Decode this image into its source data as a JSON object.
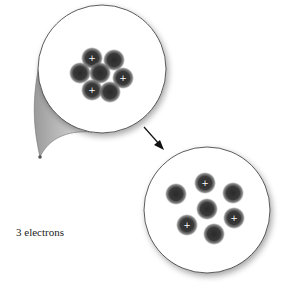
{
  "diagram": {
    "label": "3 electrons",
    "zoom_circle": {
      "cx": 102,
      "cy": 69,
      "r": 64,
      "description": "Compact nucleus (protons and neutrons clustered)",
      "particles": [
        {
          "x": 92,
          "y": 58,
          "proton": true
        },
        {
          "x": 114,
          "y": 60,
          "proton": false
        },
        {
          "x": 80,
          "y": 73,
          "proton": false
        },
        {
          "x": 100,
          "y": 73,
          "proton": false
        },
        {
          "x": 123,
          "y": 78,
          "proton": true
        },
        {
          "x": 92,
          "y": 90,
          "proton": true
        },
        {
          "x": 110,
          "y": 92,
          "proton": false
        }
      ]
    },
    "expanded_circle": {
      "cx": 207,
      "cy": 210,
      "r": 63,
      "description": "Nucleus expanded showing individual nucleons",
      "particles": [
        {
          "x": 205,
          "y": 183,
          "proton": true
        },
        {
          "x": 176,
          "y": 194,
          "proton": false
        },
        {
          "x": 233,
          "y": 193,
          "proton": false
        },
        {
          "x": 207,
          "y": 209,
          "proton": false
        },
        {
          "x": 234,
          "y": 218,
          "proton": true
        },
        {
          "x": 187,
          "y": 225,
          "proton": true
        },
        {
          "x": 214,
          "y": 234,
          "proton": false
        }
      ]
    },
    "proton_symbol": "+",
    "colors": {
      "particle": "#2b2b2b",
      "outline": "#333333",
      "cone": "#bdbdbd"
    }
  }
}
